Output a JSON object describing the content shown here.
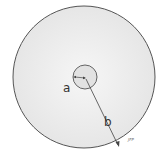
{
  "diagram": {
    "title": "",
    "outer_circle": {
      "label": "b",
      "cx": 84,
      "cy": 77,
      "r": 71
    },
    "inner_circle": {
      "label": "a",
      "cx": 85,
      "cy": 77,
      "r": 12
    },
    "labels": {
      "a": "a",
      "b": "b",
      "credit": "JFP"
    },
    "colors": {
      "stroke": "#555555",
      "fill": "#efefef",
      "text": "#333333"
    }
  }
}
